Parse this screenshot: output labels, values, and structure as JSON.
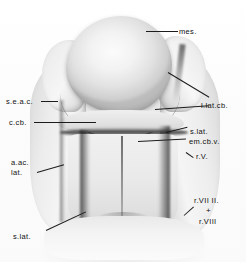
{
  "figure": {
    "kind": "anatomical-photograph",
    "view": "dorsal view of embryonic brain specimen",
    "background_color": "#fdfdfd",
    "ink_color": "#1c1c1c"
  },
  "labels": {
    "mes": "mes.",
    "l_lat_cb": "l.lat.cb.",
    "s_e_a_c": "s.e.a.c.",
    "c_cb": "c.cb.",
    "s_lat_right": "s.lat.",
    "em_cb_v": "em.cb.v.",
    "r_v": "r.V.",
    "a_ac_line1": "a.ac.",
    "a_ac_line2": "lat.",
    "r_vii_ii": "r.VII II.",
    "plus": "+",
    "r_viii": "r.VIII",
    "s_lat_bottom": "s.lat."
  }
}
